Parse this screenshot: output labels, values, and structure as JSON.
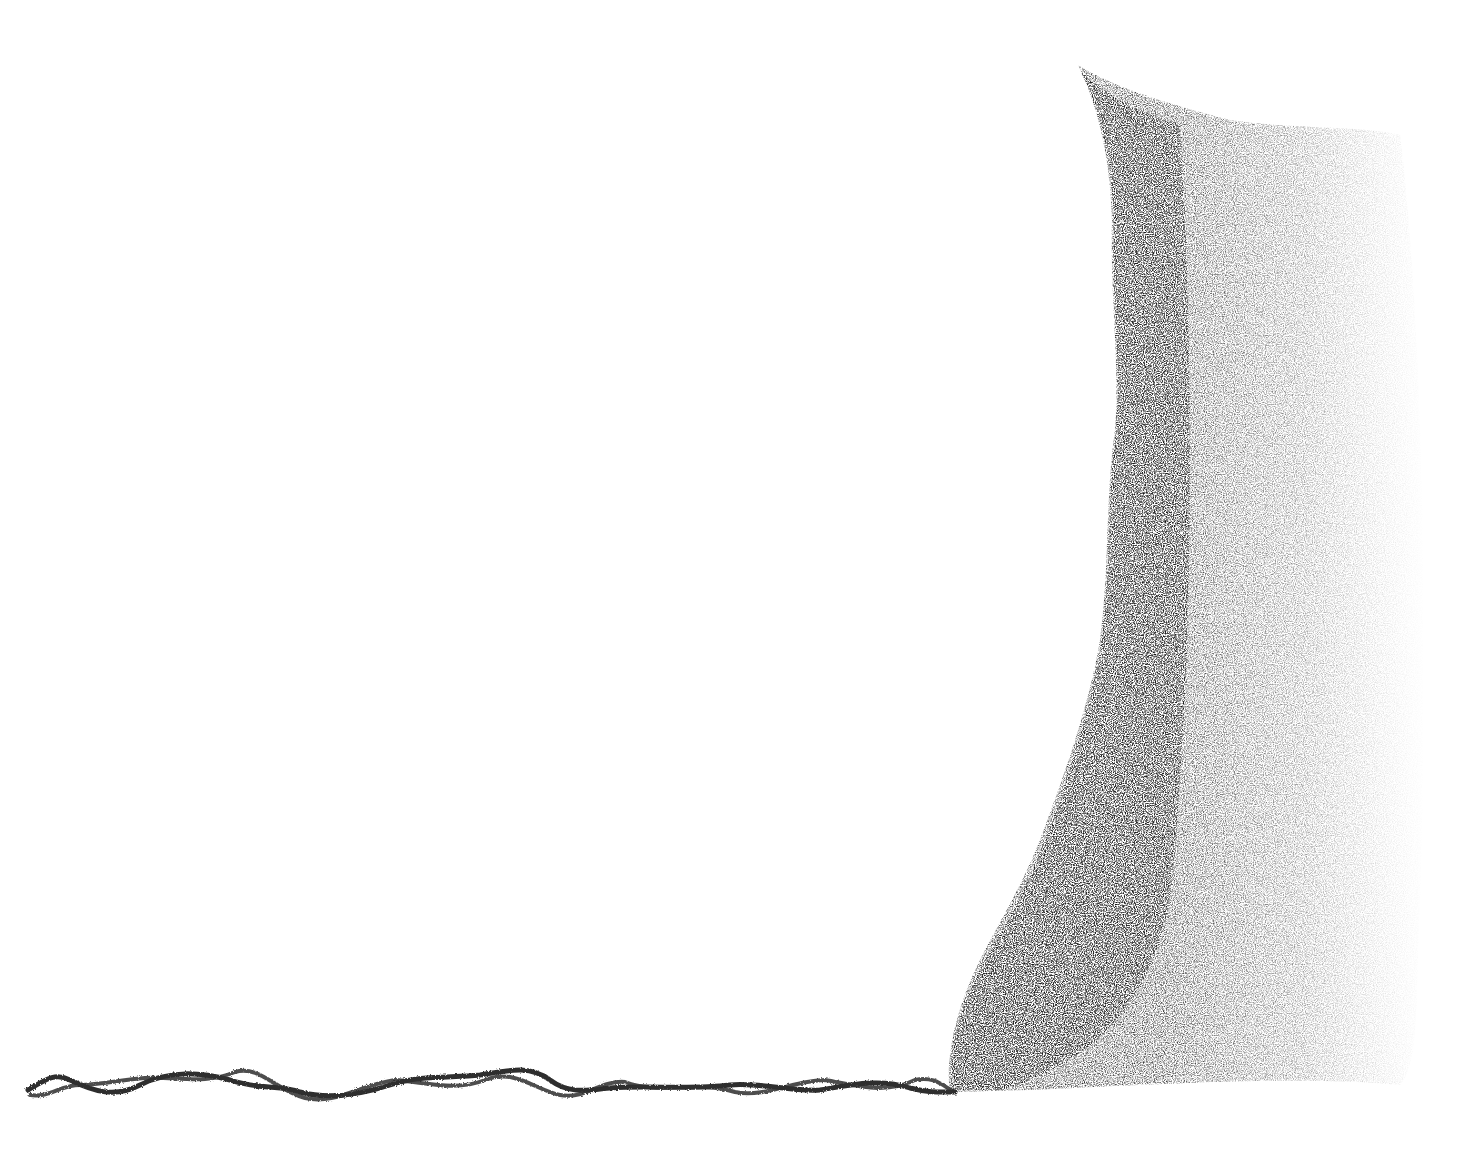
{
  "drawing": {
    "medium": "pencil",
    "background": "#ffffff",
    "ink": "#2a2a2a",
    "elements": [
      {
        "name": "wavy-strand",
        "description": "Twisted double strand along the bottom, from left to the base of the mass"
      },
      {
        "name": "stippled-mass",
        "description": "Dark stippled vertical mass on the right, fading to the right"
      }
    ]
  }
}
